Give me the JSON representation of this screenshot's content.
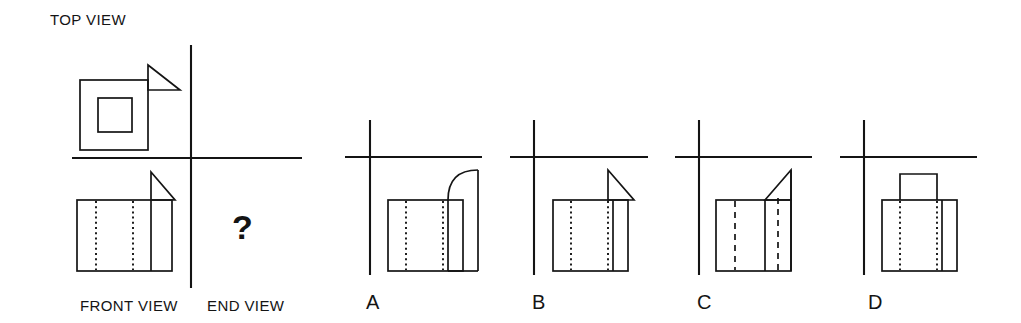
{
  "page": {
    "width": 1021,
    "height": 323,
    "background": "#ffffff",
    "ink_color": "#141414",
    "kind": "orthographic-projection-multiple-choice"
  },
  "labels": {
    "top_view": "TOP VIEW",
    "front_view": "FRONT VIEW",
    "end_view": "END VIEW",
    "question_mark": "?"
  },
  "question": {
    "prompt_symbol": "?",
    "missing_view": "END VIEW",
    "given_views": [
      "TOP VIEW",
      "FRONT VIEW"
    ]
  },
  "given_drawing": {
    "axis": {
      "vertical_x": 191,
      "vertical_y1": 45,
      "vertical_y2": 288,
      "horizontal_y": 158,
      "horizontal_x1": 72,
      "horizontal_x2": 302
    },
    "top_view": {
      "outer_rect": {
        "x": 80,
        "y": 80,
        "w": 68,
        "h": 70
      },
      "inner_rect": {
        "x": 98,
        "y": 98,
        "w": 34,
        "h": 34
      },
      "triangle_points": "148,65 180,90 148,90",
      "description": "square with concentric inner square and right-pointing triangle on upper right edge"
    },
    "front_view": {
      "rect": {
        "x": 77,
        "y": 200,
        "w": 95,
        "h": 71
      },
      "hidden_lines_x": [
        96,
        133
      ],
      "solid_divider_x": 151,
      "triangle_points": "151,172 175,200 151,200",
      "description": "rectangle with two hidden (dotted) vertical lines, one solid vertical divider, triangle above right portion"
    }
  },
  "options": [
    {
      "id": "A",
      "letter": "A",
      "axis": {
        "vertical_x": 370,
        "vertical_y1": 120,
        "vertical_y2": 275,
        "horizontal_y": 157,
        "horizontal_x1": 345,
        "horizontal_x2": 482
      },
      "rect": {
        "x": 388,
        "y": 200,
        "w": 75,
        "h": 71
      },
      "hidden_lines_x": [
        406,
        443
      ],
      "solid_divider_x": 448,
      "feature": "quarter-round-curve",
      "curve_path": "M 448 200 C 448 180 458 170 478 170",
      "curve_right_x": 478,
      "curve_top_y": 170,
      "description": "rectangle with two dotted hidden lines and a quarter-circle fillet rising to the right"
    },
    {
      "id": "B",
      "letter": "B",
      "axis": {
        "vertical_x": 534,
        "vertical_y1": 120,
        "vertical_y2": 275,
        "horizontal_y": 157,
        "horizontal_x1": 510,
        "horizontal_x2": 648
      },
      "rect": {
        "x": 553,
        "y": 200,
        "w": 75,
        "h": 71
      },
      "hidden_lines_x": [
        571,
        608
      ],
      "solid_divider_x": 613,
      "feature": "triangle-apex-left",
      "triangle_points": "608,170 634,200 608,200",
      "description": "rectangle with two dotted hidden lines and a triangle with vertical left edge and hypotenuse sloping down-right"
    },
    {
      "id": "C",
      "letter": "C",
      "axis": {
        "vertical_x": 699,
        "vertical_y1": 120,
        "vertical_y2": 275,
        "horizontal_y": 157,
        "horizontal_x1": 675,
        "horizontal_x2": 812
      },
      "rect": {
        "x": 716,
        "y": 200,
        "w": 75,
        "h": 71
      },
      "hidden_lines_x": [
        735,
        778
      ],
      "solid_divider_x": 765,
      "feature": "triangle-rising-right",
      "triangle_points": "765,200 791,170 791,200",
      "description": "rectangle with two dashed hidden lines and a triangle whose hypotenuse rises from left to upper right"
    },
    {
      "id": "D",
      "letter": "D",
      "axis": {
        "vertical_x": 864,
        "vertical_y1": 120,
        "vertical_y2": 275,
        "horizontal_y": 157,
        "horizontal_x1": 840,
        "horizontal_x2": 977
      },
      "rect": {
        "x": 882,
        "y": 200,
        "w": 75,
        "h": 71
      },
      "hidden_lines_x": [
        900,
        937
      ],
      "solid_divider_x": 942,
      "feature": "raised-boss-rectangle",
      "boss_rect": {
        "x": 900,
        "y": 174,
        "w": 37,
        "h": 26
      },
      "description": "rectangle with two dotted hidden lines and a small rectangular block standing on top"
    }
  ]
}
